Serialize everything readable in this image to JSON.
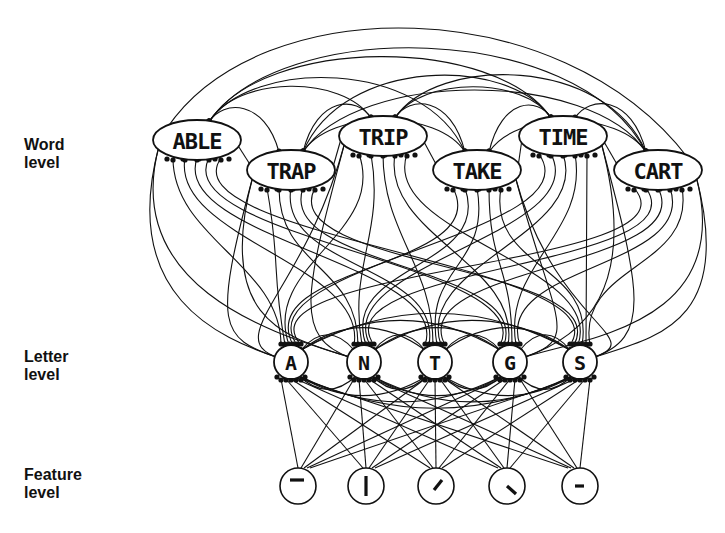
{
  "levels": {
    "word": {
      "line1": "Word",
      "line2": "level"
    },
    "letter": {
      "line1": "Letter",
      "line2": "level"
    },
    "feature": {
      "line1": "Feature",
      "line2": "level"
    }
  },
  "word_nodes": [
    {
      "label": "ABLE",
      "cx": 197,
      "cy": 140
    },
    {
      "label": "TRAP",
      "cx": 291,
      "cy": 170
    },
    {
      "label": "TRIP",
      "cx": 383,
      "cy": 136
    },
    {
      "label": "TAKE",
      "cx": 477,
      "cy": 170
    },
    {
      "label": "TIME",
      "cx": 563,
      "cy": 136
    },
    {
      "label": "CART",
      "cx": 658,
      "cy": 170
    }
  ],
  "letter_nodes": [
    {
      "label": "A",
      "cx": 291,
      "cy": 362
    },
    {
      "label": "N",
      "cx": 364,
      "cy": 362
    },
    {
      "label": "T",
      "cx": 435,
      "cy": 362
    },
    {
      "label": "G",
      "cx": 510,
      "cy": 362
    },
    {
      "label": "S",
      "cx": 580,
      "cy": 362
    }
  ],
  "feature_nodes": [
    {
      "feature": "horizontal-top-bar",
      "cx": 298,
      "cy": 486
    },
    {
      "feature": "vertical-bar",
      "cx": 366,
      "cy": 486
    },
    {
      "feature": "forward-diagonal",
      "cx": 436,
      "cy": 486
    },
    {
      "feature": "back-diagonal",
      "cx": 507,
      "cy": 486
    },
    {
      "feature": "horizontal-mid-bar",
      "cx": 580,
      "cy": 486
    }
  ],
  "colors": {
    "ink": "#111111",
    "background": "#ffffff"
  }
}
